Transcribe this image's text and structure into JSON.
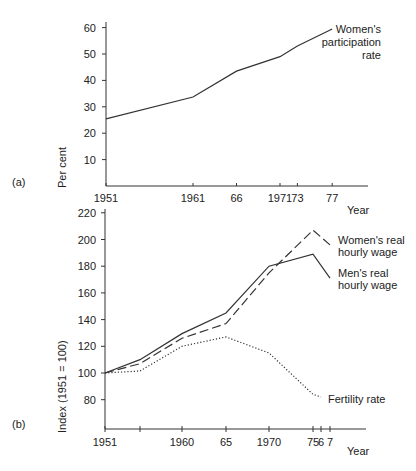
{
  "figure": {
    "panel_a": {
      "tag": "(a)",
      "ylabel": "Per cent",
      "xlabel": "Year",
      "series_label": [
        "Women's",
        "participation",
        "rate"
      ]
    },
    "panel_b": {
      "tag": "(b)",
      "ylabel": "Index (1951 = 100)",
      "xlabel": "Year",
      "labels": {
        "women_wage": [
          "Women's real",
          "hourly wage"
        ],
        "men_wage": [
          "Men's real",
          "hourly wage"
        ],
        "fertility": [
          "Fertility rate"
        ]
      }
    }
  },
  "chart_data": [
    {
      "panel": "(a)",
      "type": "line",
      "title": "",
      "xlabel": "Year",
      "ylabel": "Per cent",
      "x": [
        1951,
        1961,
        1966,
        1971,
        1973,
        1977
      ],
      "x_tick_labels": [
        "1951",
        "1961",
        "66",
        "1971",
        "73",
        "77"
      ],
      "y_ticks": [
        10,
        20,
        30,
        40,
        50,
        60
      ],
      "ylim": [
        0,
        62
      ],
      "grid": false,
      "series": [
        {
          "name": "Women's participation rate",
          "style": "solid",
          "values": [
            25.4,
            33.7,
            43.5,
            49,
            53,
            59.5
          ]
        }
      ]
    },
    {
      "panel": "(b)",
      "type": "line",
      "title": "",
      "xlabel": "Year",
      "ylabel": "Index (1951 = 100)",
      "x": [
        1951,
        1955,
        1960,
        1965,
        1970,
        1975,
        1977
      ],
      "x_tick_labels": [
        "1951",
        "",
        "1960",
        "65",
        "1970",
        "75",
        "6",
        "7"
      ],
      "x_tick_years": [
        1951,
        1955,
        1960,
        1965,
        1970,
        1975,
        1976,
        1977
      ],
      "y_ticks": [
        80,
        100,
        120,
        140,
        160,
        180,
        200,
        220
      ],
      "ylim": [
        60,
        222
      ],
      "grid": false,
      "series": [
        {
          "name": "Men's real hourly wage",
          "style": "solid",
          "points": [
            [
              1951,
              100
            ],
            [
              1955,
              110
            ],
            [
              1960,
              129.5
            ],
            [
              1965,
              145
            ],
            [
              1970,
              180
            ],
            [
              1975,
              189
            ],
            [
              1977,
              171
            ]
          ]
        },
        {
          "name": "Women's real hourly wage",
          "style": "dashed",
          "points": [
            [
              1951,
              100
            ],
            [
              1955,
              107
            ],
            [
              1960,
              126
            ],
            [
              1965,
              137
            ],
            [
              1970,
              175
            ],
            [
              1975,
              207
            ],
            [
              1977,
              196
            ]
          ]
        },
        {
          "name": "Fertility rate",
          "style": "dotted",
          "points": [
            [
              1951,
              100
            ],
            [
              1955,
              101.5
            ],
            [
              1960,
              120
            ],
            [
              1965,
              127
            ],
            [
              1970,
              115
            ],
            [
              1975,
              84
            ],
            [
              1976,
              82
            ]
          ]
        }
      ]
    }
  ]
}
